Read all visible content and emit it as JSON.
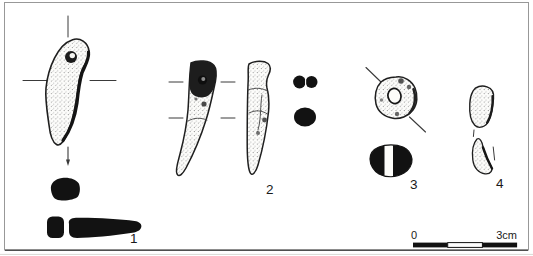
{
  "figure": {
    "items": [
      {
        "label": "1",
        "name": "curved-perforated-pendant"
      },
      {
        "label": "2",
        "name": "tooth-pendant-two-views"
      },
      {
        "label": "3",
        "name": "perforated-ring-bead"
      },
      {
        "label": "4",
        "name": "small-worked-fragments"
      }
    ],
    "scale_bar": {
      "start_label": "0",
      "end_label": "3cm"
    }
  },
  "colors": {
    "background": "#ffffff",
    "frame_border": "#989898",
    "ink": "#1a1a1a",
    "section_fill": "#121212",
    "stipple_dot": "#777777"
  }
}
